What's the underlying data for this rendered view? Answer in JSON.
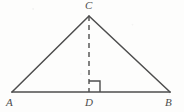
{
  "figure": {
    "kind": "euclidean-geometry-diagram",
    "canvas": {
      "width": 184,
      "height": 112
    },
    "stroke_color": "#4d4d4d",
    "background_color": "#fdfdfc",
    "points": {
      "A": {
        "label": "A",
        "x": 12,
        "y": 92,
        "label_x": 6,
        "label_y": 97
      },
      "B": {
        "label": "B",
        "x": 170,
        "y": 92,
        "label_x": 165,
        "label_y": 97
      },
      "C": {
        "label": "C",
        "x": 89,
        "y": 16,
        "label_x": 85,
        "label_y": 0
      },
      "D": {
        "label": "D",
        "x": 89,
        "y": 92,
        "label_x": 85,
        "label_y": 97
      }
    },
    "segments": [
      {
        "name": "side-AB",
        "from": "A",
        "to": "B",
        "style": "solid",
        "width": 1.7
      },
      {
        "name": "side-AC",
        "from": "A",
        "to": "C",
        "style": "solid",
        "width": 1.5
      },
      {
        "name": "side-CB",
        "from": "C",
        "to": "B",
        "style": "solid",
        "width": 1.5
      },
      {
        "name": "altitude-CD",
        "from": "C",
        "to": "D",
        "style": "dashed",
        "width": 1.4,
        "dash_pattern": "5 4"
      }
    ],
    "right_angle_mark": {
      "name": "right-angle-at-D",
      "vertex": "D",
      "size": 11,
      "orientation": "opens-up-right",
      "degrees": 90
    }
  }
}
